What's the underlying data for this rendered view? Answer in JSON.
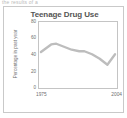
{
  "top_strip": {
    "clipped_text": "the results of a"
  },
  "card": {
    "border_color": "#c9c9c9"
  },
  "chart_data": {
    "type": "line",
    "title": "Teenage Drug Use",
    "xlabel": "",
    "ylabel": "Percentage in past year",
    "xlim": [
      1975,
      2004
    ],
    "ylim": [
      0,
      80
    ],
    "grid": false,
    "legend": "none",
    "line_color": "#bdbdbd",
    "x_tick_labels": [
      "1975",
      "2004"
    ],
    "y_tick_labels": [
      "0",
      "20",
      "40",
      "60",
      "80"
    ],
    "y_ticks": [
      0,
      20,
      40,
      60,
      80
    ],
    "series": [
      {
        "name": "Percentage in past year",
        "x": [
          1975,
          1977,
          1979,
          1981,
          1984,
          1987,
          1990,
          1992,
          1995,
          1998,
          2001,
          2004
        ],
        "values": [
          44,
          49,
          54,
          55,
          51,
          47,
          45,
          45,
          41,
          35,
          27,
          41
        ]
      }
    ]
  }
}
